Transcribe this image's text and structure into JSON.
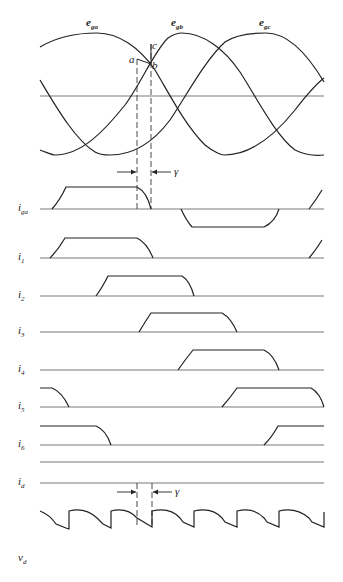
{
  "diagram": {
    "type": "three-phase-bridge-rectifier-commutation-waveforms",
    "voltage_labels": {
      "e_ga": {
        "base": "e",
        "sub": "ga"
      },
      "e_gb": {
        "base": "e",
        "sub": "gb"
      },
      "e_gc": {
        "base": "e",
        "sub": "gc"
      }
    },
    "points": {
      "a": "a",
      "b": "b",
      "c": "c"
    },
    "overlap_angle_label": "γ",
    "overlap_angle_label_bottom": "γ",
    "current_labels": [
      {
        "id": "iga",
        "base": "i",
        "sub": "ga"
      },
      {
        "id": "i1",
        "base": "i",
        "sub": "1"
      },
      {
        "id": "i2",
        "base": "i",
        "sub": "2"
      },
      {
        "id": "i3",
        "base": "i",
        "sub": "3"
      },
      {
        "id": "i4",
        "base": "i",
        "sub": "4"
      },
      {
        "id": "i5",
        "base": "i",
        "sub": "5"
      },
      {
        "id": "i6",
        "base": "i",
        "sub": "6"
      },
      {
        "id": "id",
        "base": "i",
        "sub": "d"
      }
    ],
    "output_voltage_label": {
      "base": "v",
      "sub": "d"
    },
    "colors": {
      "stroke": "#222222",
      "axis": "#555555",
      "background": "#ffffff"
    }
  }
}
